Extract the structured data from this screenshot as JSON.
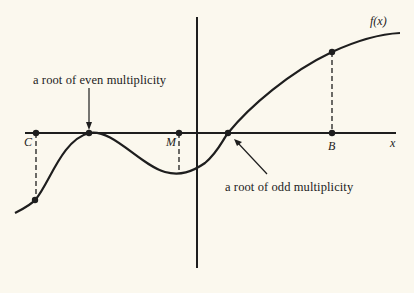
{
  "figure": {
    "curve_label": "f(x)",
    "axis_label_x": "x",
    "points": {
      "C": "C",
      "M": "M",
      "B": "B"
    },
    "annotations": {
      "even_root": "a root of even multiplicity",
      "odd_root": "a root of odd multiplicity"
    },
    "colors": {
      "background": "#fbf8ee",
      "ink": "#1e1e1e"
    }
  }
}
